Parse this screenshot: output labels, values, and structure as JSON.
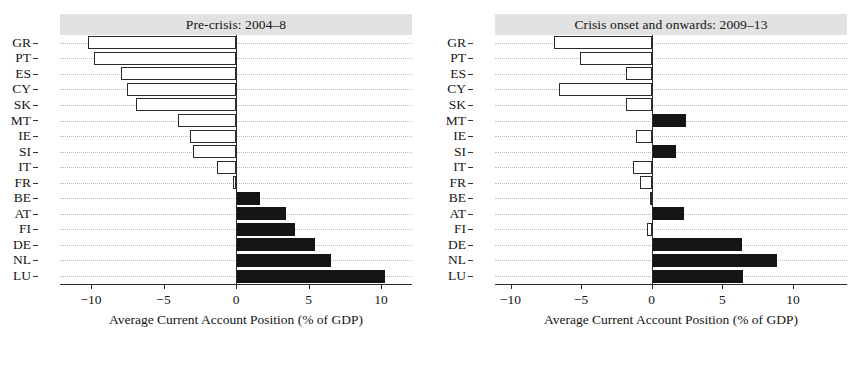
{
  "chart_data": [
    {
      "type": "bar",
      "orientation": "horizontal",
      "title": "Pre-crisis: 2004–8",
      "xlabel": "Average Current Account Position (% of GDP)",
      "ylabel": "",
      "xlim": [
        -13.5,
        13.5
      ],
      "xticks": [
        -10,
        -5,
        0,
        5,
        10
      ],
      "xticklabels": [
        "−10",
        "−5",
        "0",
        "5",
        "10"
      ],
      "grid": true,
      "categories": [
        "GR",
        "PT",
        "ES",
        "CY",
        "SK",
        "MT",
        "IE",
        "SI",
        "IT",
        "FR",
        "BE",
        "AT",
        "FI",
        "DE",
        "NL",
        "LU"
      ],
      "values": [
        -10.2,
        -9.8,
        -7.9,
        -7.5,
        -6.9,
        -4.0,
        -3.2,
        -3.0,
        -1.3,
        -0.2,
        1.65,
        3.45,
        4.1,
        5.45,
        6.55,
        10.3
      ]
    },
    {
      "type": "bar",
      "orientation": "horizontal",
      "title": "Crisis onset and onwards: 2009–13",
      "xlabel": "Average Current Account Position (% of GDP)",
      "ylabel": "",
      "xlim": [
        -13.5,
        13.5
      ],
      "xticks": [
        -10,
        -5,
        0,
        5,
        10
      ],
      "xticklabels": [
        "−10",
        "−5",
        "0",
        "5",
        "10"
      ],
      "grid": true,
      "categories": [
        "GR",
        "PT",
        "ES",
        "CY",
        "SK",
        "MT",
        "IE",
        "SI",
        "IT",
        "FR",
        "BE",
        "AT",
        "FI",
        "DE",
        "NL",
        "LU"
      ],
      "values": [
        -6.9,
        -5.1,
        -1.8,
        -6.6,
        -1.8,
        2.4,
        -1.1,
        1.7,
        -1.35,
        -0.85,
        -0.15,
        2.3,
        -0.3,
        6.4,
        8.9,
        6.5
      ]
    }
  ],
  "colors": {
    "negative_bar_fill": "#ffffff",
    "negative_bar_border": "#2b2b2b",
    "positive_bar_fill": "#151515",
    "title_strip_background": "#e2e2e2",
    "gridline": "#b9b9b9",
    "axis": "#2b2b2b",
    "text": "#161616",
    "page_background": "#ffffff"
  }
}
